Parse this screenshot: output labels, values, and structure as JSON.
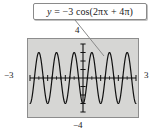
{
  "figure": {
    "callout": {
      "equation_plain": "y = -3 cos(2πx + 4π)",
      "lhs": "y",
      "equals": "=",
      "amplitude_sign": "−3",
      "func": "cos(",
      "arg": "2πx + 4π",
      "close": ")"
    },
    "labels": {
      "top": "4",
      "bottom": "−4",
      "left": "−3",
      "right": "3"
    },
    "colors": {
      "plot_background": "#d6d6d4",
      "plot_border": "#8d8d8d",
      "curve": "#111111",
      "axis": "#111111",
      "callout_border": "#8a8a8a",
      "callout_background": "#ffffff",
      "text": "#1b1b1b"
    }
  },
  "chart_data": {
    "type": "line",
    "title": "",
    "subtitle": "",
    "xlabel": "",
    "ylabel": "",
    "xlim": [
      -3,
      3
    ],
    "ylim": [
      -4,
      4
    ],
    "xticks": [
      -3,
      -2,
      -1,
      0,
      1,
      2,
      3
    ],
    "yticks": [
      -4,
      -3,
      -2,
      -1,
      0,
      1,
      2,
      3,
      4
    ],
    "grid": false,
    "legend": null,
    "annotations": [
      {
        "text": "y = -3 cos(2πx + 4π)",
        "kind": "callout-box",
        "points_to": [
          1.25,
          2.4
        ]
      }
    ],
    "series": [
      {
        "name": "y = -3 cos(2πx + 4π)",
        "amplitude": -3,
        "period": 1,
        "phase_shift": -2,
        "vertical_shift": 0,
        "expression": "-3*cos(2*pi*x + 4*pi)",
        "cycles_shown": 6,
        "x": [
          -3,
          -2.75,
          -2.5,
          -2.25,
          -2,
          -1.75,
          -1.5,
          -1.25,
          -1,
          -0.75,
          -0.5,
          -0.25,
          0,
          0.25,
          0.5,
          0.75,
          1,
          1.25,
          1.5,
          1.75,
          2,
          2.25,
          2.5,
          2.75,
          3
        ],
        "values": [
          -3,
          0,
          3,
          0,
          -3,
          0,
          3,
          0,
          -3,
          0,
          3,
          0,
          -3,
          0,
          3,
          0,
          -3,
          0,
          3,
          0,
          -3,
          0,
          3,
          0,
          -3
        ]
      }
    ]
  }
}
